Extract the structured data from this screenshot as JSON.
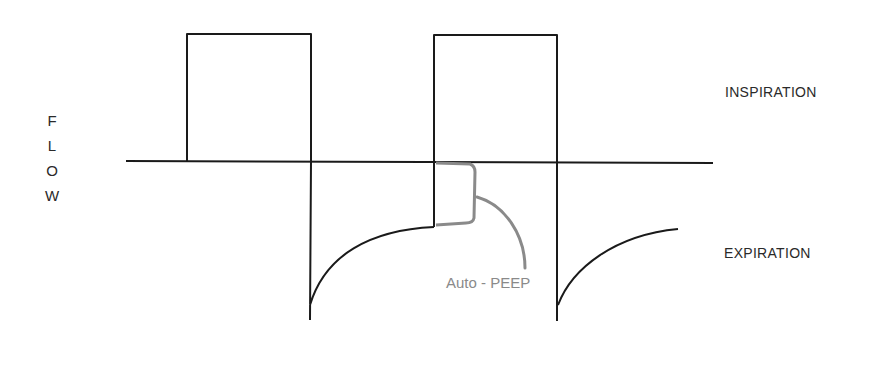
{
  "diagram": {
    "y_axis_label": [
      "F",
      "L",
      "O",
      "W"
    ],
    "labels": {
      "inspiration": "INSPIRATION",
      "expiration": "EXPIRATION",
      "auto_peep": "Auto - PEEP"
    },
    "colors": {
      "waveform": "#1a1a1a",
      "auto_peep": "#8a8a8a",
      "text": "#2a2a2a"
    }
  }
}
